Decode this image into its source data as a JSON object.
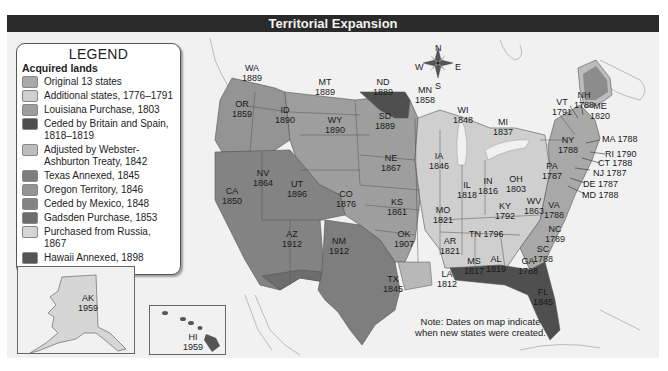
{
  "title": "Territorial Expansion",
  "legend": {
    "heading": "LEGEND",
    "subheading": "Acquired lands",
    "items": [
      {
        "label": "Original 13 states",
        "color": "#a9a9a9"
      },
      {
        "label": "Additional states, 1776–1791",
        "color": "#cfcfcf"
      },
      {
        "label": "Louisiana Purchase, 1803",
        "color": "#9e9e9e"
      },
      {
        "label": "Ceded by Britain and Spain, 1818–1819",
        "color": "#4f4f4f"
      },
      {
        "label": "Adjusted by Webster-Ashburton Treaty, 1842",
        "color": "#bdbdbd"
      },
      {
        "label": "Texas Annexed, 1845",
        "color": "#7e7e7e"
      },
      {
        "label": "Oregon Territory, 1846",
        "color": "#949494"
      },
      {
        "label": "Ceded by Mexico, 1848",
        "color": "#838383"
      },
      {
        "label": "Gadsden Purchase, 1853",
        "color": "#6d6d6d"
      },
      {
        "label": "Purchased from Russia, 1867",
        "color": "#d6d6d6"
      },
      {
        "label": "Hawaii Annexed, 1898",
        "color": "#555555"
      }
    ]
  },
  "compass": {
    "n": "N",
    "s": "S",
    "e": "E",
    "w": "W"
  },
  "states": [
    {
      "abbr": "WA",
      "year": "1889"
    },
    {
      "abbr": "OR",
      "year": "1859"
    },
    {
      "abbr": "ID",
      "year": "1890"
    },
    {
      "abbr": "MT",
      "year": "1889"
    },
    {
      "abbr": "ND",
      "year": "1889"
    },
    {
      "abbr": "MN",
      "year": "1858"
    },
    {
      "abbr": "WY",
      "year": "1890"
    },
    {
      "abbr": "SD",
      "year": "1889"
    },
    {
      "abbr": "WI",
      "year": "1848"
    },
    {
      "abbr": "MI",
      "year": "1837"
    },
    {
      "abbr": "CA",
      "year": "1850"
    },
    {
      "abbr": "NV",
      "year": "1864"
    },
    {
      "abbr": "UT",
      "year": "1896"
    },
    {
      "abbr": "CO",
      "year": "1876"
    },
    {
      "abbr": "NE",
      "year": "1867"
    },
    {
      "abbr": "IA",
      "year": "1846"
    },
    {
      "abbr": "KS",
      "year": "1861"
    },
    {
      "abbr": "MO",
      "year": "1821"
    },
    {
      "abbr": "IL",
      "year": "1818"
    },
    {
      "abbr": "IN",
      "year": "1816"
    },
    {
      "abbr": "OH",
      "year": "1803"
    },
    {
      "abbr": "AZ",
      "year": "1912"
    },
    {
      "abbr": "NM",
      "year": "1912"
    },
    {
      "abbr": "OK",
      "year": "1907"
    },
    {
      "abbr": "AR",
      "year": "1821"
    },
    {
      "abbr": "TX",
      "year": "1845"
    },
    {
      "abbr": "LA",
      "year": "1812"
    },
    {
      "abbr": "MS",
      "year": "1817"
    },
    {
      "abbr": "AL",
      "year": "1819"
    },
    {
      "abbr": "GA",
      "year": "1788"
    },
    {
      "abbr": "FL",
      "year": "1845"
    },
    {
      "abbr": "TN",
      "year": "1796"
    },
    {
      "abbr": "KY",
      "year": "1792"
    },
    {
      "abbr": "WV",
      "year": "1863"
    },
    {
      "abbr": "VA",
      "year": "1788"
    },
    {
      "abbr": "NC",
      "year": "1789"
    },
    {
      "abbr": "SC",
      "year": "1788"
    },
    {
      "abbr": "PA",
      "year": "1787"
    },
    {
      "abbr": "NY",
      "year": "1788"
    },
    {
      "abbr": "VT",
      "year": "1791"
    },
    {
      "abbr": "NH",
      "year": "1788"
    },
    {
      "abbr": "ME",
      "year": "1820"
    },
    {
      "abbr": "AK",
      "year": "1959"
    },
    {
      "abbr": "HI",
      "year": "1959"
    }
  ],
  "callouts": [
    {
      "text": "MA 1788"
    },
    {
      "text": "RI 1790"
    },
    {
      "text": "CT 1788"
    },
    {
      "text": "NJ 1787"
    },
    {
      "text": "DE 1787"
    },
    {
      "text": "MD 1788"
    }
  ],
  "note": "Note: Dates on map indicate when new states were created."
}
